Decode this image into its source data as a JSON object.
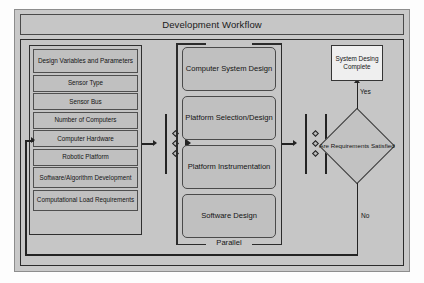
{
  "figure": {
    "title": "Development Workflow"
  },
  "input_group": {
    "name": "design-variables-group",
    "header": "Design Variables and Parameters",
    "items": [
      {
        "label": "Sensor Type"
      },
      {
        "label": "Sensor Bus"
      },
      {
        "label": "Number of Computers"
      },
      {
        "label": "Computer Hardware"
      },
      {
        "label": "Robotic Platform"
      },
      {
        "label": "Software/Algorithm Development"
      },
      {
        "label": "Computational Load Requirements"
      }
    ]
  },
  "parallel_group": {
    "bracket_label": "Parallel",
    "tasks": [
      {
        "label": "Computer System Design"
      },
      {
        "label": "Platform Selection/Design"
      },
      {
        "label": "Platform Instrumentation"
      },
      {
        "label": "Software Design"
      }
    ]
  },
  "decision": {
    "label": "Are Requirements Satisfied",
    "yes_label": "Yes",
    "no_label": "No"
  },
  "terminal": {
    "label": "System Desing Complete"
  },
  "sync_bars": {
    "left_name": "fork-sync-bar-left",
    "right_name": "join-sync-bar-right",
    "marker_count": 3
  },
  "colors": {
    "page_background": "#fdfdfd",
    "figure_background": "#c9c9c9",
    "panel_fill": "#c6c6c6",
    "box_fill": "#c0c0c0",
    "terminal_fill": "#efefef",
    "stroke": "#2b2b2b",
    "text": "#141414"
  }
}
